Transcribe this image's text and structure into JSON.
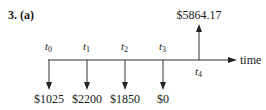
{
  "heading": "3. (a)",
  "axis_label": "time",
  "time_points": [
    {
      "var": "t",
      "sub": "0",
      "flow": "$1025",
      "direction": "down"
    },
    {
      "var": "t",
      "sub": "1",
      "flow": "$2200",
      "direction": "down"
    },
    {
      "var": "t",
      "sub": "2",
      "flow": "$1850",
      "direction": "down"
    },
    {
      "var": "t",
      "sub": "3",
      "flow": "$0",
      "direction": "down"
    },
    {
      "var": "t",
      "sub": "4",
      "flow": "$5864.17",
      "direction": "up"
    }
  ],
  "colors": {
    "ink": "#1a1a1a",
    "line": "#333333"
  }
}
